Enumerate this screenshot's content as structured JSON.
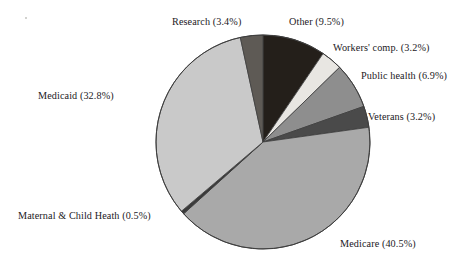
{
  "chart_data": {
    "type": "pie",
    "title": "",
    "subtitle": "",
    "xlabel": "",
    "ylabel": "",
    "legend_position": "none",
    "label_format": "{name} ({value}%)",
    "grid": false,
    "total_percent": 100.0,
    "categories": [
      "Other",
      "Workers' comp.",
      "Public health",
      "Veterans",
      "Medicare",
      "Maternal & Child Heath",
      "Medicaid",
      "Research"
    ],
    "values": [
      9.5,
      3.2,
      6.9,
      3.2,
      40.5,
      0.5,
      32.8,
      3.4
    ],
    "colors": [
      "#241f1a",
      "#e8e6e2",
      "#8e8e8e",
      "#4a4a4a",
      "#a9a9a9",
      "#3a3a3a",
      "#c9c9c9",
      "#5e5a55"
    ],
    "slices": [
      {
        "name": "Other",
        "value": 9.5,
        "label": "Other (9.5%)",
        "color": "#241f1a"
      },
      {
        "name": "Workers' comp.",
        "value": 3.2,
        "label": "Workers' comp. (3.2%)",
        "color": "#e8e6e2"
      },
      {
        "name": "Public health",
        "value": 6.9,
        "label": "Public health (6.9%)",
        "color": "#8e8e8e"
      },
      {
        "name": "Veterans",
        "value": 3.2,
        "label": "Veterans (3.2%)",
        "color": "#4a4a4a"
      },
      {
        "name": "Medicare",
        "value": 40.5,
        "label": "Medicare (40.5%)",
        "color": "#a9a9a9"
      },
      {
        "name": "Maternal & Child Heath",
        "value": 0.5,
        "label": "Maternal & Child Heath (0.5%)",
        "color": "#3a3a3a"
      },
      {
        "name": "Medicaid",
        "value": 32.8,
        "label": "Medicaid (32.8%)",
        "color": "#c9c9c9"
      },
      {
        "name": "Research",
        "value": 3.4,
        "label": "Research (3.4%)",
        "color": "#5e5a55"
      }
    ],
    "geometry": {
      "center_x": 263,
      "center_y": 142,
      "radius": 107,
      "start_angle_deg": 0,
      "direction": "clockwise",
      "stroke_color": "#3d3d3d",
      "stroke_width": 0.8
    }
  },
  "labels": {
    "research": "Research (3.4%)",
    "other": "Other (9.5%)",
    "workers_comp": "Workers' comp. (3.2%)",
    "public_health": "Public health (6.9%)",
    "veterans": "Veterans (3.2%)",
    "medicaid": "Medicaid (32.8%)",
    "maternal_child_health": "Maternal & Child Heath (0.5%)",
    "medicare": "Medicare (40.5%)"
  }
}
